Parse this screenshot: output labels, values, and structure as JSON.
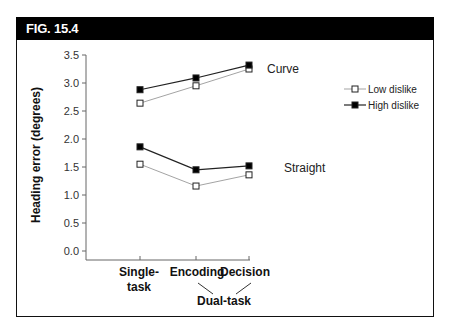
{
  "figure": {
    "label": "FIG. 15.4"
  },
  "chart_data": {
    "type": "line",
    "title": "",
    "xlabel": "",
    "ylabel": "Heading error (degrees)",
    "ylim": [
      0.0,
      3.5
    ],
    "yticks": [
      "0.0",
      "0.5",
      "1.0",
      "1.5",
      "2.0",
      "2.5",
      "3.0",
      "3.5"
    ],
    "categories": [
      "Single-task",
      "Encoding",
      "Decision"
    ],
    "category_labels": [
      [
        "Single-",
        "task"
      ],
      [
        "Encoding"
      ],
      [
        "Decision"
      ]
    ],
    "group_label": {
      "text": "Dual-task",
      "groups": [
        "Encoding",
        "Decision"
      ]
    },
    "grid": false,
    "legend_position": "upper right",
    "legend": [
      "Low dislike",
      "High dislike"
    ],
    "annotations": [
      "Curve",
      "Straight"
    ],
    "series": [
      {
        "name": "Low dislike",
        "condition": "Curve",
        "marker": "open-square",
        "values": [
          2.64,
          2.95,
          3.25
        ]
      },
      {
        "name": "High dislike",
        "condition": "Curve",
        "marker": "filled-square",
        "values": [
          2.88,
          3.09,
          3.32
        ]
      },
      {
        "name": "Low dislike",
        "condition": "Straight",
        "marker": "open-square",
        "values": [
          1.55,
          1.16,
          1.36
        ]
      },
      {
        "name": "High dislike",
        "condition": "Straight",
        "marker": "filled-square",
        "values": [
          1.86,
          1.45,
          1.52
        ]
      }
    ]
  }
}
